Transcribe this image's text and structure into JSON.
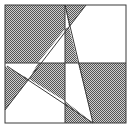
{
  "diagram": {
    "colors": {
      "background": "#ffffff",
      "line": "#3a3a3a",
      "hatch_dark": "#555555",
      "hatch_light": "#cfcfcf"
    },
    "square": {
      "x": 5,
      "y": 5,
      "w": 121,
      "h": 118
    },
    "midlines": {
      "vx": 65,
      "hy": 63
    },
    "lines": [
      {
        "id": "diag-a",
        "x1": 86,
        "y1": 5,
        "x2": 5,
        "y2": 110
      },
      {
        "id": "diag-b",
        "x1": 65,
        "y1": 5,
        "x2": 93,
        "y2": 123
      },
      {
        "id": "diag-c",
        "x1": 7,
        "y1": 66,
        "x2": 93,
        "y2": 123
      }
    ],
    "shaded_regions": [
      {
        "id": "tl-main",
        "points": "5,5 65,5 65,29 38,63 5,63"
      },
      {
        "id": "top-wedge",
        "points": "65,5 86,5 69,27"
      },
      {
        "id": "mid-sliver",
        "points": "65,29 69,27 78,63 65,63"
      },
      {
        "id": "bl-left",
        "points": "5,66 29,79 5,110"
      },
      {
        "id": "bl-mid",
        "points": "38,63 65,63 65,101 29,79"
      },
      {
        "id": "br-main",
        "points": "78,63 126,63 126,123 93,123"
      },
      {
        "id": "br-bottom",
        "points": "65,101 93,123 65,123"
      }
    ]
  }
}
